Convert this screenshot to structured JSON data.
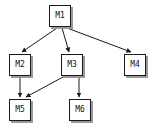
{
  "diagram": {
    "type": "directed-graph",
    "title": "",
    "canvas": {
      "width": 151,
      "height": 129
    },
    "style": {
      "background_color": "#ffffff",
      "node_fill": "#ffffff",
      "node_border_color": "#1a1a1a",
      "node_shadow_color": "#9a9a9a",
      "edge_color": "#1a1a1a",
      "label_color": "#111111"
    },
    "nodes": [
      {
        "id": "M1",
        "label": "M1",
        "x": 49,
        "y": 5
      },
      {
        "id": "M2",
        "label": "M2",
        "x": 9,
        "y": 54
      },
      {
        "id": "M3",
        "label": "M3",
        "x": 61,
        "y": 54
      },
      {
        "id": "M4",
        "label": "M4",
        "x": 124,
        "y": 54
      },
      {
        "id": "M5",
        "label": "M5",
        "x": 9,
        "y": 99
      },
      {
        "id": "M6",
        "label": "M6",
        "x": 69,
        "y": 99
      }
    ],
    "edges": [
      {
        "from": "M1",
        "to": "M2",
        "x1": 57,
        "y1": 28,
        "x2": 22,
        "y2": 52
      },
      {
        "from": "M1",
        "to": "M3",
        "x1": 62,
        "y1": 28,
        "x2": 69,
        "y2": 52
      },
      {
        "from": "M1",
        "to": "M4",
        "x1": 67,
        "y1": 28,
        "x2": 131,
        "y2": 52
      },
      {
        "from": "M2",
        "to": "M5",
        "x1": 20,
        "y1": 77,
        "x2": 20,
        "y2": 97
      },
      {
        "from": "M3",
        "to": "M5",
        "x1": 63,
        "y1": 77,
        "x2": 26,
        "y2": 97
      },
      {
        "from": "M3",
        "to": "M6",
        "x1": 79,
        "y1": 77,
        "x2": 79,
        "y2": 97
      }
    ]
  }
}
